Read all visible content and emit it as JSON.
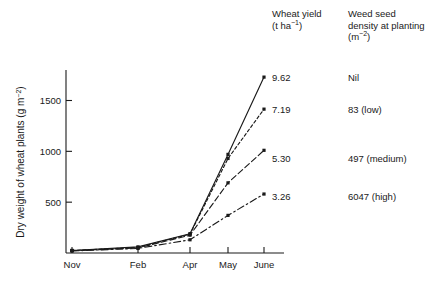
{
  "legend": {
    "headers": {
      "yield": "Wheat yield (t ha⁻¹)",
      "yield_line1": "Wheat yield",
      "yield_line2_pre": "(t ha",
      "yield_line2_sup": "−1",
      "yield_line2_post": ")",
      "density_line1": "Weed seed",
      "density_line2": "density at planting",
      "density_line3_pre": "(m",
      "density_line3_sup": "−2",
      "density_line3_post": ")"
    },
    "rows": [
      {
        "yield": "9.62",
        "density": "Nil"
      },
      {
        "yield": "7.19",
        "density": "83 (low)"
      },
      {
        "yield": "5.30",
        "density": "497 (medium)"
      },
      {
        "yield": "3.26",
        "density": "6047 (high)"
      }
    ]
  },
  "chart_data": {
    "type": "line",
    "title": "",
    "xlabel": "",
    "ylabel": "Dry weight of wheat plants (g m⁻²)",
    "ylabel_pre": "Dry weight of wheat plants (g m",
    "ylabel_sup": "−2",
    "ylabel_post": ")",
    "categories": [
      "Nov",
      "Feb",
      "Apr",
      "May",
      "June"
    ],
    "xtick_labels": [
      "Nov",
      "Feb",
      "Apr",
      "May",
      "June"
    ],
    "ytick_labels": [
      "500",
      "1000",
      "1500"
    ],
    "yticks": [
      500,
      1000,
      1500
    ],
    "ylim": [
      0,
      1800
    ],
    "grid": false,
    "legend_position": "right-table",
    "series": [
      {
        "name": "Nil",
        "yield": "9.62",
        "density": "Nil",
        "style": "solid",
        "values": [
          25,
          60,
          190,
          970,
          1730
        ]
      },
      {
        "name": "83 (low)",
        "yield": "7.19",
        "density": "83 (low)",
        "style": "dotted",
        "values": [
          25,
          55,
          185,
          930,
          1415
        ]
      },
      {
        "name": "497 (medium)",
        "yield": "5.30",
        "density": "497 (medium)",
        "style": "dashed",
        "values": [
          22,
          50,
          175,
          690,
          1010
        ]
      },
      {
        "name": "6047 (high)",
        "yield": "3.26",
        "density": "6047 (high)",
        "style": "dashdot",
        "values": [
          20,
          45,
          130,
          370,
          580
        ]
      }
    ]
  }
}
